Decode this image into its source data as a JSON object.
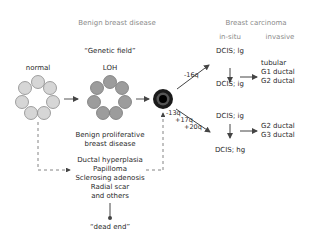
{
  "headers": {
    "benign": "Benign breast disease",
    "carcinoma": "Breast carcinoma",
    "in_situ": "in-situ",
    "invasive": "invasive"
  },
  "stages": {
    "genetic_field": "“Genetic field”",
    "normal": "normal",
    "loh": "LOH"
  },
  "benign_proliferative": [
    "Benign proliferative",
    "breast disease"
  ],
  "benign_list": [
    "Ductal hyperplasia",
    "Papilloma",
    "Sclerosing adenosis",
    "Radial scar",
    "and others"
  ],
  "dead_end": "“dead end”",
  "pathways": {
    "upper_label": "-16q",
    "lower_labels": [
      "-13q",
      "+17q",
      "+20q"
    ]
  },
  "dcis": {
    "upper_top": "DCIS; lg",
    "upper_bottom": "DCIS; ig",
    "lower_top": "DCIS; ig",
    "lower_bottom": "DCIS; hg"
  },
  "invasive_upper": [
    "tubular",
    "G1 ductal",
    "G2 ductal"
  ],
  "invasive_lower": [
    "G2 ductal",
    "G3 ductal"
  ],
  "colors": {
    "normal_cell": "#d4d4d4",
    "loh_cell": "#9a9a9a",
    "cell_stroke": "#7a7a7a",
    "tumor_outer": "#1a1a1a",
    "arrow": "#555555",
    "header_text": "#8a8a8a"
  }
}
